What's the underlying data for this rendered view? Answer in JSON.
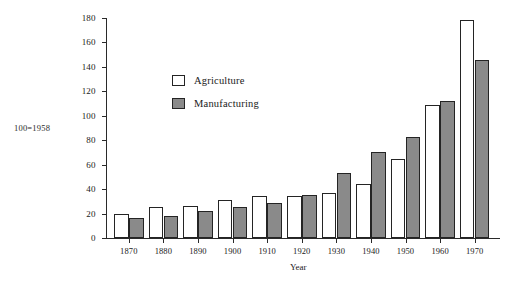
{
  "chart_data": {
    "type": "bar",
    "title": "",
    "subtitle": "",
    "xlabel": "Year",
    "ylabel": "",
    "unit_note": "100=1958",
    "categories": [
      "1870",
      "1880",
      "1890",
      "1900",
      "1910",
      "1920",
      "1930",
      "1940",
      "1950",
      "1960",
      "1970"
    ],
    "series": [
      {
        "name": "Agriculture",
        "values": [
          20,
          25,
          26,
          31,
          34,
          34,
          37,
          44,
          65,
          109,
          178
        ]
      },
      {
        "name": "Manufacturing",
        "values": [
          16,
          18,
          22,
          25,
          29,
          35,
          53,
          70,
          83,
          112,
          146
        ]
      }
    ],
    "ylim": [
      0,
      180
    ],
    "yticks": [
      0,
      20,
      40,
      60,
      80,
      100,
      120,
      140,
      160,
      180
    ],
    "ytick_labels": [
      "0",
      "20",
      "40",
      "60",
      "80",
      "100",
      "120",
      "140",
      "160",
      "180"
    ],
    "grid": false,
    "legend_position": "inside-upper-left",
    "colors": {
      "agriculture": "#ffffff",
      "manufacturing": "#8a8a8a",
      "bar_border": "#242424",
      "axis": "#2a2a2a",
      "text": "#1a1a1a",
      "background": "#ffffff"
    }
  }
}
